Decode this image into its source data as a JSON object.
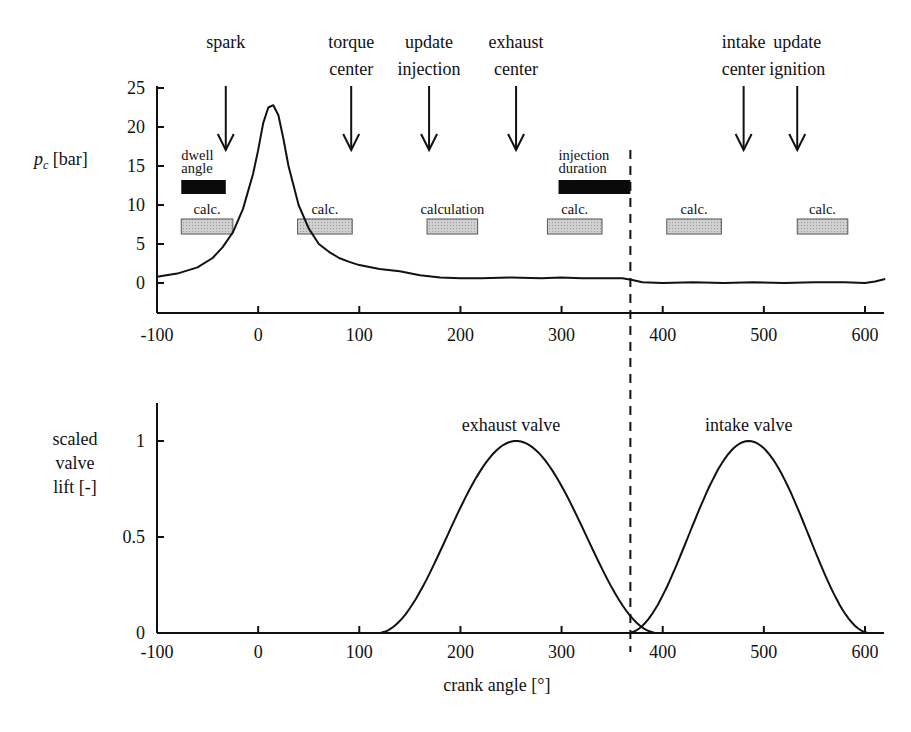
{
  "chart_data": [
    {
      "type": "line",
      "title": "",
      "panel": "top",
      "xlabel": "",
      "ylabel": "p_c [bar]",
      "ylabel_main": "p",
      "ylabel_sub": "c",
      "ylabel_unit": "[bar]",
      "xlim": [
        -100,
        620
      ],
      "ylim": [
        -4,
        25
      ],
      "xticks": [
        -100,
        0,
        100,
        200,
        300,
        400,
        500,
        600
      ],
      "yticks": [
        0,
        5,
        10,
        15,
        20,
        25
      ],
      "grid": false,
      "series": [
        {
          "name": "cylinder pressure",
          "x": [
            -100,
            -80,
            -60,
            -45,
            -35,
            -25,
            -15,
            -5,
            0,
            5,
            10,
            15,
            20,
            25,
            30,
            40,
            50,
            60,
            70,
            80,
            90,
            100,
            120,
            140,
            160,
            180,
            200,
            220,
            250,
            280,
            300,
            320,
            340,
            360,
            370,
            380,
            400,
            430,
            460,
            490,
            520,
            550,
            580,
            600,
            610,
            620
          ],
          "values": [
            0.8,
            1.2,
            2.0,
            3.2,
            4.6,
            6.5,
            9.5,
            14.0,
            17.0,
            20.5,
            22.5,
            22.8,
            21.5,
            18.5,
            15.0,
            10.0,
            7.0,
            5.0,
            4.0,
            3.2,
            2.7,
            2.3,
            1.8,
            1.5,
            1.0,
            0.7,
            0.6,
            0.6,
            0.7,
            0.6,
            0.7,
            0.6,
            0.6,
            0.6,
            0.4,
            0.1,
            0.0,
            0.1,
            0.0,
            0.1,
            0.0,
            0.1,
            0.1,
            0.0,
            0.2,
            0.5
          ]
        }
      ],
      "events": [
        {
          "label": [
            "spark"
          ],
          "x": -32
        },
        {
          "label": [
            "torque",
            "center"
          ],
          "x": 92
        },
        {
          "label": [
            "update",
            "injection"
          ],
          "x": 169
        },
        {
          "label": [
            "exhaust",
            "center"
          ],
          "x": 255
        },
        {
          "label": [
            "intake",
            "center"
          ],
          "x": 480
        },
        {
          "label": [
            "update",
            "ignition"
          ],
          "x": 533
        }
      ],
      "bars": [
        {
          "label": [
            "dwell",
            "angle"
          ],
          "start": -76,
          "end": -32,
          "kind": "black",
          "row": "upper"
        },
        {
          "label": [
            "injection",
            "duration"
          ],
          "start": 297,
          "end": 368,
          "kind": "black",
          "row": "upper"
        },
        {
          "label": [
            "calc."
          ],
          "start": -76,
          "end": -25,
          "kind": "gray",
          "row": "lower"
        },
        {
          "label": [
            "calc."
          ],
          "start": 39,
          "end": 93,
          "kind": "gray",
          "row": "lower"
        },
        {
          "label": [
            "calculation"
          ],
          "start": 167,
          "end": 217,
          "kind": "gray",
          "row": "lower"
        },
        {
          "label": [
            "calc."
          ],
          "start": 286,
          "end": 340,
          "kind": "gray",
          "row": "lower"
        },
        {
          "label": [
            "calc."
          ],
          "start": 404,
          "end": 458,
          "kind": "gray",
          "row": "lower"
        },
        {
          "label": [
            "calc."
          ],
          "start": 533,
          "end": 583,
          "kind": "gray",
          "row": "lower"
        }
      ]
    },
    {
      "type": "line",
      "title": "",
      "panel": "bottom",
      "xlabel": "crank angle [°]",
      "ylabel": "scaled valve lift [-]",
      "ylabel_lines": [
        "scaled",
        "valve",
        "lift [-]"
      ],
      "xlim": [
        -100,
        620
      ],
      "ylim": [
        0,
        1.2
      ],
      "xticks": [
        -100,
        0,
        100,
        200,
        300,
        400,
        500,
        600
      ],
      "yticks": [
        0,
        0.5,
        1
      ],
      "ytick_labels": [
        "0",
        "0.5",
        "1"
      ],
      "grid": false,
      "series": [
        {
          "name": "exhaust valve",
          "open": 118,
          "peak": 255,
          "close": 395,
          "max": 1.0,
          "label_x": 250,
          "label_y": 1.05
        },
        {
          "name": "intake valve",
          "open": 365,
          "peak": 485,
          "close": 605,
          "max": 1.0,
          "label_x": 485,
          "label_y": 1.05
        }
      ]
    }
  ],
  "annotations": {
    "marker_line_crank_angle": 370,
    "marker_line_style": "dashed"
  },
  "colors": {
    "ink": "#111111",
    "calc_bar_fill": "#c8c8c8",
    "calc_bar_stroke": "#555555",
    "black_bar": "#0a0a0a"
  }
}
